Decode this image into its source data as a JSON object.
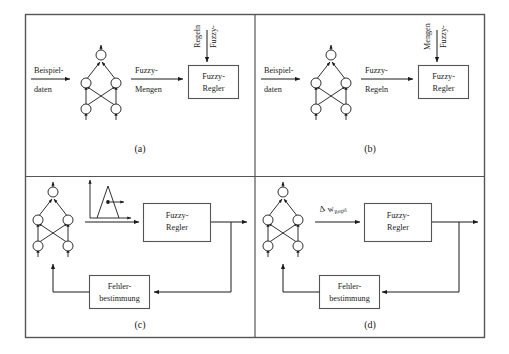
{
  "figure": {
    "border_color": "#555555",
    "line_color": "#1a1a1a",
    "background": "#ffffff"
  },
  "panels": [
    {
      "id": "a",
      "caption": "(a)",
      "network": {
        "layers": [
          1,
          2,
          2
        ],
        "crossed": true
      },
      "input_label_line1": "Beispiel-",
      "input_label_line2": "daten",
      "middle_label_line1": "Fuzzy-",
      "middle_label_line2": "Mengen",
      "vertical_label_line1": "Fuzzy-",
      "vertical_label_line2": "Regeln",
      "controller_line1": "Fuzzy-",
      "controller_line2": "Regler"
    },
    {
      "id": "b",
      "caption": "(b)",
      "network": {
        "layers": [
          1,
          2,
          2
        ],
        "crossed": true
      },
      "input_label_line1": "Beispiel-",
      "input_label_line2": "daten",
      "middle_label_line1": "Fuzzy-",
      "middle_label_line2": "Regeln",
      "vertical_label_line1": "Fuzzy-",
      "vertical_label_line2": "Mengen",
      "controller_line1": "Fuzzy-",
      "controller_line2": "Regler"
    },
    {
      "id": "c",
      "caption": "(c)",
      "network": {
        "layers": [
          1,
          2,
          2
        ],
        "crossed": true
      },
      "membership_plot": "triangular-membership-function",
      "controller_line1": "Fuzzy-",
      "controller_line2": "Regler",
      "error_box_line1": "Fehler-",
      "error_box_line2": "bestimmung"
    },
    {
      "id": "d",
      "caption": "(d)",
      "network": {
        "layers": [
          1,
          2,
          2
        ],
        "crossed": true
      },
      "delta_symbol": "Δ",
      "delta_var": "w",
      "delta_subscript": "Regel",
      "controller_line1": "Fuzzy-",
      "controller_line2": "Regler",
      "error_box_line1": "Fehler-",
      "error_box_line2": "bestimmung"
    }
  ]
}
